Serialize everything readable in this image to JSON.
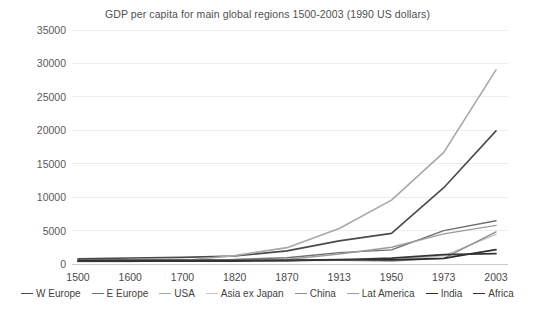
{
  "chart_data": {
    "type": "line",
    "title": "GDP per capita for main global regions 1500-2003 (1990 US dollars)",
    "xlabel": "",
    "ylabel": "",
    "categories": [
      "1500",
      "1600",
      "1700",
      "1820",
      "1870",
      "1913",
      "1950",
      "1973",
      "2003"
    ],
    "ylim": [
      0,
      35000
    ],
    "yticks": [
      0,
      5000,
      10000,
      15000,
      20000,
      25000,
      30000,
      35000
    ],
    "ytick_labels": [
      "0",
      "5000",
      "10000",
      "15000",
      "20000",
      "25000",
      "30000",
      "35000"
    ],
    "grid": true,
    "legend_position": "bottom",
    "series": [
      {
        "name": "W Europe",
        "color": "#4a4a4a",
        "width": 1.6,
        "values": [
          771,
          889,
          997,
          1202,
          1960,
          3457,
          4578,
          11416,
          19912
        ]
      },
      {
        "name": "E Europe",
        "color": "#6e6e6e",
        "width": 1.4,
        "values": [
          496,
          548,
          606,
          683,
          937,
          1695,
          2111,
          4988,
          6476
        ]
      },
      {
        "name": "USA",
        "color": "#a8a8a8",
        "width": 1.6,
        "values": [
          400,
          400,
          527,
          1257,
          2445,
          5301,
          9561,
          16689,
          29037
        ]
      },
      {
        "name": "Asia ex Japan",
        "color": "#c2c2c2",
        "width": 1.4,
        "values": [
          572,
          576,
          572,
          577,
          548,
          658,
          634,
          1226,
          4434
        ]
      },
      {
        "name": "China",
        "color": "#8f8f8f",
        "width": 1.4,
        "values": [
          600,
          600,
          600,
          600,
          530,
          552,
          448,
          838,
          4803
        ]
      },
      {
        "name": "Lat America",
        "color": "#9c9c9c",
        "width": 1.4,
        "values": [
          416,
          438,
          527,
          691,
          676,
          1494,
          2503,
          4504,
          5786
        ]
      },
      {
        "name": "India",
        "color": "#2e2e2e",
        "width": 1.7,
        "values": [
          550,
          550,
          550,
          533,
          533,
          673,
          619,
          853,
          2160
        ]
      },
      {
        "name": "Africa",
        "color": "#353535",
        "width": 1.7,
        "values": [
          414,
          422,
          421,
          420,
          500,
          637,
          890,
          1410,
          1549
        ]
      }
    ]
  }
}
